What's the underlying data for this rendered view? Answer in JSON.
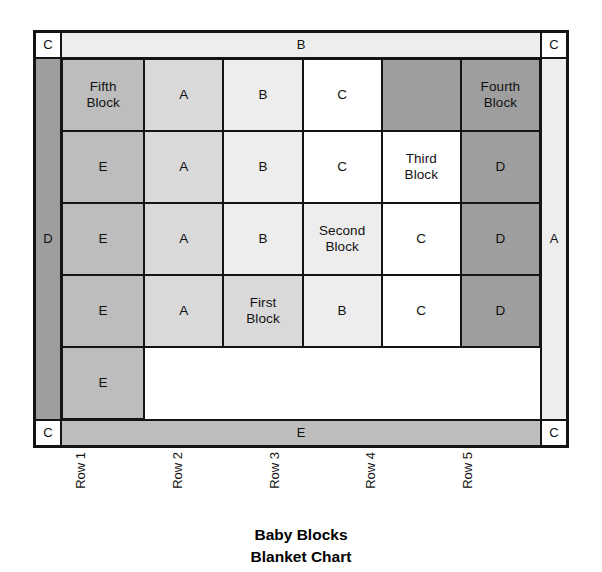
{
  "chart_data": {
    "type": "table",
    "title": "Baby Blocks",
    "subtitle": "Blanket Chart",
    "legend_shades": {
      "A": "#d9d9d9",
      "B": "#ededed",
      "C": "#ffffff",
      "D": "#9e9e9e",
      "E": "#bdbdbd"
    },
    "border_labels": {
      "top_left": "C",
      "top": "B",
      "top_right": "C",
      "left": "D",
      "right": "A",
      "bottom_left": "C",
      "bottom": "E",
      "bottom_right": "C"
    },
    "row_label_header": "",
    "column_labels": [
      "Row 1",
      "Row 2",
      "Row 3",
      "Row 4",
      "Row 5"
    ],
    "row_labels": [
      "Fifth\nBlock",
      "Fourth\nBlock",
      "Third\nBlock",
      "Second\nBlock",
      "First\nBlock"
    ],
    "row_label_shades": [
      "E",
      "D",
      "C",
      "B",
      "A"
    ],
    "grid": [
      [
        "A",
        "B",
        "C",
        "D",
        ""
      ],
      [
        "E",
        "A",
        "B",
        "C",
        ""
      ],
      [
        "D",
        "E",
        "A",
        "B",
        ""
      ],
      [
        "C",
        "D",
        "E",
        "A",
        ""
      ],
      [
        "B",
        "C",
        "D",
        "E",
        ""
      ]
    ],
    "cells": [
      [
        {
          "label": "",
          "shade": "E"
        },
        {
          "label": "A",
          "shade": "A"
        },
        {
          "label": "B",
          "shade": "B"
        },
        {
          "label": "C",
          "shade": "C"
        },
        {
          "label": "",
          "shade": "D"
        }
      ],
      [
        {
          "label": "",
          "shade": "D"
        },
        {
          "label": "E",
          "shade": "E"
        },
        {
          "label": "A",
          "shade": "A"
        },
        {
          "label": "B",
          "shade": "B"
        },
        {
          "label": "C",
          "shade": "C"
        }
      ],
      [
        {
          "label": "",
          "shade": "C"
        },
        {
          "label": "D",
          "shade": "D"
        },
        {
          "label": "E",
          "shade": "E"
        },
        {
          "label": "A",
          "shade": "A"
        },
        {
          "label": "B",
          "shade": "B"
        }
      ],
      [
        {
          "label": "",
          "shade": "B"
        },
        {
          "label": "C",
          "shade": "C"
        },
        {
          "label": "D",
          "shade": "D"
        },
        {
          "label": "E",
          "shade": "E"
        },
        {
          "label": "A",
          "shade": "A"
        }
      ],
      [
        {
          "label": "",
          "shade": "A"
        },
        {
          "label": "B",
          "shade": "B"
        },
        {
          "label": "C",
          "shade": "C"
        },
        {
          "label": "D",
          "shade": "D"
        },
        {
          "label": "E",
          "shade": "E"
        }
      ]
    ]
  },
  "frame": {
    "corner_tl": "C",
    "corner_tr": "C",
    "corner_bl": "C",
    "corner_br": "C",
    "band_top": "B",
    "band_bottom": "E",
    "side_left": "D",
    "side_right": "A"
  },
  "blocks": [
    {
      "label": "Fifth\nBlock",
      "shade": "E"
    },
    {
      "label": "Fourth\nBlock",
      "shade": "D"
    },
    {
      "label": "Third\nBlock",
      "shade": "C"
    },
    {
      "label": "Second\nBlock",
      "shade": "B"
    },
    {
      "label": "First\nBlock",
      "shade": "A"
    }
  ],
  "rows": [
    {
      "label": "Row 1"
    },
    {
      "label": "Row 2"
    },
    {
      "label": "Row 3"
    },
    {
      "label": "Row 4"
    },
    {
      "label": "Row 5"
    }
  ],
  "title": {
    "line1": "Baby Blocks",
    "line2": "Blanket Chart"
  }
}
